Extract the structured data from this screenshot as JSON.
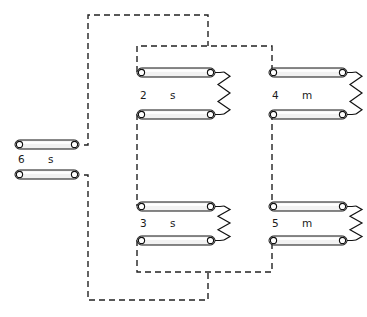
{
  "diagram": {
    "type": "winding-connection-schematic",
    "canvas": {
      "width": 367,
      "height": 317,
      "background": "#ffffff"
    },
    "colors": {
      "line": "#111111",
      "dashed_wire": "#222222",
      "bar_fill": "#f2f2f2",
      "terminal_fill": "#ffffff",
      "label": "#1a1a1a"
    },
    "coils": [
      {
        "id": "coil-6",
        "number": "6",
        "type": "s",
        "label_number_x": 18,
        "label_type_x": 48,
        "label_y": 160,
        "has_resistor": false,
        "bars": [
          {
            "x": 15,
            "y": 140,
            "width": 64,
            "height": 9
          },
          {
            "x": 15,
            "y": 170,
            "width": 64,
            "height": 9
          }
        ]
      },
      {
        "id": "coil-2",
        "number": "2",
        "type": "s",
        "label_number_x": 140,
        "label_type_x": 170,
        "label_y": 96,
        "has_resistor": true,
        "bars": [
          {
            "x": 137,
            "y": 68,
            "width": 78,
            "height": 9
          },
          {
            "x": 137,
            "y": 110,
            "width": 78,
            "height": 9
          }
        ],
        "resistor": {
          "x": 224,
          "y_top": 72,
          "y_bottom": 114,
          "amplitude": 6,
          "zigs": 5
        }
      },
      {
        "id": "coil-4",
        "number": "4",
        "type": "m",
        "label_number_x": 272,
        "label_type_x": 302,
        "label_y": 96,
        "has_resistor": true,
        "bars": [
          {
            "x": 269,
            "y": 68,
            "width": 78,
            "height": 9
          },
          {
            "x": 269,
            "y": 110,
            "width": 78,
            "height": 9
          }
        ],
        "resistor": {
          "x": 356,
          "y_top": 72,
          "y_bottom": 114,
          "amplitude": 6,
          "zigs": 5
        }
      },
      {
        "id": "coil-3",
        "number": "3",
        "type": "s",
        "label_number_x": 140,
        "label_type_x": 170,
        "label_y": 224,
        "has_resistor": true,
        "bars": [
          {
            "x": 137,
            "y": 202,
            "width": 78,
            "height": 9
          },
          {
            "x": 137,
            "y": 236,
            "width": 78,
            "height": 9
          }
        ],
        "resistor": {
          "x": 224,
          "y_top": 206,
          "y_bottom": 240,
          "amplitude": 6,
          "zigs": 5
        }
      },
      {
        "id": "coil-5",
        "number": "5",
        "type": "m",
        "label_number_x": 272,
        "label_type_x": 302,
        "label_y": 224,
        "has_resistor": true,
        "bars": [
          {
            "x": 269,
            "y": 202,
            "width": 78,
            "height": 9
          },
          {
            "x": 269,
            "y": 236,
            "width": 78,
            "height": 9
          }
        ],
        "resistor": {
          "x": 356,
          "y_top": 206,
          "y_bottom": 240,
          "amplitude": 6,
          "zigs": 5
        }
      }
    ],
    "wires": [
      {
        "id": "wire-outer-top",
        "description": "coil-6 top terminal up and across to inner loop top right stub",
        "path": "M 84 145 L 88 145 L 88 15 L 208 15 L 208 46"
      },
      {
        "id": "wire-inner-top",
        "description": "inner loop top: coil-2 top down-lead up across to coil-4 top down-lead",
        "path": "M 137 72 L 137 46 L 272 46 L 272 72"
      },
      {
        "id": "wire-left-column",
        "description": "coil-2 lower bar left terminal down to coil-3 upper bar left terminal",
        "path": "M 137 114 L 137 206"
      },
      {
        "id": "wire-right-column",
        "description": "coil-4 lower bar left terminal down to coil-5 upper bar left terminal",
        "path": "M 272 114 L 272 206"
      },
      {
        "id": "wire-inner-bottom",
        "description": "inner loop bottom: coil-3 lower lead down across to coil-5 lower lead",
        "path": "M 137 240 L 137 272 L 272 272 L 272 240"
      },
      {
        "id": "wire-outer-bottom",
        "description": "coil-6 lower terminal down and across to inner loop bottom stub",
        "path": "M 84 175 L 88 175 L 88 300 L 208 300 L 208 272"
      }
    ]
  }
}
